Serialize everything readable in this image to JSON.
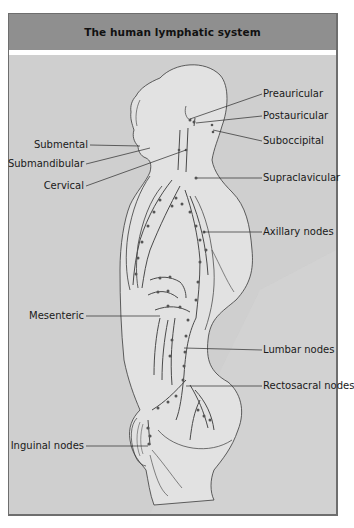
{
  "figure": {
    "title": "The human lymphatic system",
    "colors": {
      "header_bg": "#8f8f8f",
      "content_bg": "#cfcfcf",
      "body_fill": "#e2e2e2",
      "line": "#3a3a3a",
      "node": "#555555"
    },
    "labels": {
      "right": [
        {
          "text": "Preauricular"
        },
        {
          "text": "Postauricular"
        },
        {
          "text": "Suboccipital"
        },
        {
          "text": "Supraclavicular"
        },
        {
          "text": "Axillary nodes"
        },
        {
          "text": "Lumbar nodes"
        },
        {
          "text": "Rectosacral nodes"
        }
      ],
      "left": [
        {
          "text": "Submental"
        },
        {
          "text": "Submandibular"
        },
        {
          "text": "Cervical"
        },
        {
          "text": "Mesenteric"
        },
        {
          "text": "Inguinal nodes"
        }
      ]
    }
  }
}
